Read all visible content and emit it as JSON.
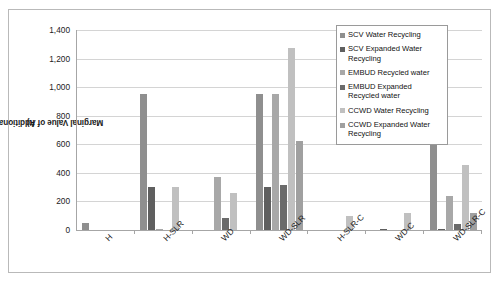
{
  "chart_data": {
    "type": "bar",
    "title": "",
    "xlabel": "",
    "ylabel": "Marginal Value of Additional Capacity ($/ac-ft)",
    "ylim": [
      0,
      1400
    ],
    "ytick_labels": [
      "1,400",
      "1,200",
      "1,000",
      "800",
      "600",
      "400",
      "200",
      "0"
    ],
    "ytick_values": [
      1400,
      1200,
      1000,
      800,
      600,
      400,
      200,
      0
    ],
    "grid": true,
    "legend_position": "inside-top-right",
    "categories": [
      "H",
      "H-SLR",
      "WD",
      "WD-SLR",
      "H-SLR-C",
      "WD-C",
      "WD-SLR-C"
    ],
    "series": [
      {
        "name": "SCV Water Recycling",
        "color": "#8f8f8f",
        "values": [
          50,
          950,
          0,
          950,
          0,
          0,
          650
        ]
      },
      {
        "name": "SCV Expanded Water Recycling",
        "color": "#5f5f5f",
        "values": [
          0,
          300,
          0,
          300,
          0,
          8,
          10
        ]
      },
      {
        "name": "EMBUD Recycled water",
        "color": "#a8a8a8",
        "values": [
          0,
          5,
          370,
          950,
          0,
          0,
          235
        ]
      },
      {
        "name": "EMBUD Expanded Recycled water",
        "color": "#6b6b6b",
        "values": [
          0,
          0,
          85,
          315,
          0,
          0,
          45
        ]
      },
      {
        "name": "CCWD Water Recycling",
        "color": "#c0c0c0",
        "values": [
          0,
          300,
          260,
          1275,
          100,
          120,
          455
        ]
      },
      {
        "name": "CCWD Expanded Water Recycling",
        "color": "#a0a0a0",
        "values": [
          0,
          0,
          0,
          625,
          0,
          0,
          120
        ]
      }
    ]
  },
  "axis": {
    "y_title_line1": "Marginal Value of Additional Capacity ($/ac-",
    "y_title_line2": "ft)"
  }
}
